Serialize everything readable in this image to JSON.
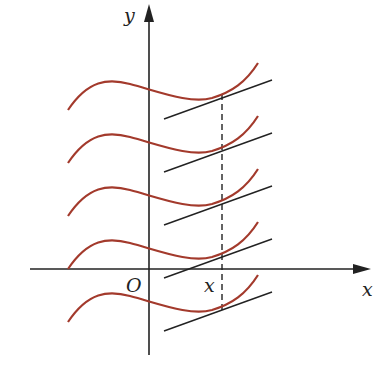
{
  "figure": {
    "colors": {
      "curve": "#a33a2c",
      "axis": "#222222",
      "tangent": "#222222",
      "dashed": "#222222"
    },
    "labels": {
      "y_axis": "y",
      "x_axis": "x",
      "origin": "O",
      "x_point": "x"
    },
    "curve_count": 5,
    "curve_offsets_px": [
      0,
      53,
      106,
      159,
      212
    ]
  }
}
